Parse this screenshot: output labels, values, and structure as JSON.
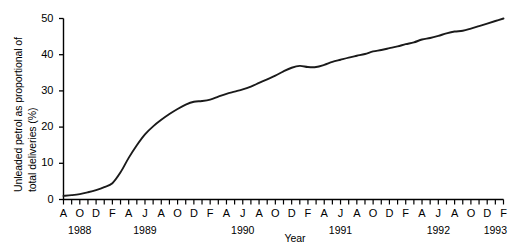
{
  "chart_data": {
    "type": "line",
    "title": "",
    "xlabel": "Year",
    "ylabel": "Unleaded petrol as proportional of total deliveries (%)",
    "ylabel_line1": "Unleaded petrol as proportional of",
    "ylabel_line2": "total deliveries (%)",
    "ylim": [
      0,
      50
    ],
    "yticks": [
      0,
      10,
      20,
      30,
      40,
      50
    ],
    "ytick_labels": [
      "0",
      "10",
      "20",
      "30",
      "40",
      "50"
    ],
    "xtick_labels": [
      "A",
      "O",
      "D",
      "F",
      "A",
      "J",
      "A",
      "O",
      "D",
      "F",
      "A",
      "J",
      "A",
      "O",
      "D",
      "F",
      "A",
      "J",
      "A",
      "O",
      "D",
      "F",
      "A",
      "J",
      "A",
      "O",
      "D",
      "F"
    ],
    "x_minor_ticks": 55,
    "year_labels": [
      "1988",
      "1989",
      "1990",
      "1991",
      "1992",
      "1993"
    ],
    "grid": false,
    "legend": "none",
    "line_color": "#1a1a1a",
    "x": [
      "1988-08",
      "1988-09",
      "1988-10",
      "1988-11",
      "1988-12",
      "1989-01",
      "1989-02",
      "1989-03",
      "1989-04",
      "1989-05",
      "1989-06",
      "1989-07",
      "1989-08",
      "1989-09",
      "1989-10",
      "1989-11",
      "1989-12",
      "1990-01",
      "1990-02",
      "1990-03",
      "1990-04",
      "1990-05",
      "1990-06",
      "1990-07",
      "1990-08",
      "1990-09",
      "1990-10",
      "1990-11",
      "1990-12",
      "1991-01",
      "1991-02",
      "1991-03",
      "1991-04",
      "1991-05",
      "1991-06",
      "1991-07",
      "1991-08",
      "1991-09",
      "1991-10",
      "1991-11",
      "1991-12",
      "1992-01",
      "1992-02",
      "1992-03",
      "1992-04",
      "1992-05",
      "1992-06",
      "1992-07",
      "1992-08",
      "1992-09",
      "1992-10",
      "1992-11",
      "1992-12",
      "1993-01",
      "1993-02"
    ],
    "values": [
      1.0,
      1.2,
      1.5,
      2.0,
      2.6,
      3.4,
      4.5,
      7.5,
      11.5,
      15.0,
      18.0,
      20.2,
      22.0,
      23.6,
      25.0,
      26.2,
      27.0,
      27.2,
      27.6,
      28.4,
      29.2,
      29.8,
      30.4,
      31.2,
      32.2,
      33.2,
      34.2,
      35.4,
      36.4,
      36.9,
      36.6,
      36.6,
      37.2,
      38.0,
      38.6,
      39.2,
      39.7,
      40.2,
      40.9,
      41.3,
      41.8,
      42.3,
      42.9,
      43.4,
      44.2,
      44.6,
      45.2,
      45.9,
      46.4,
      46.6,
      47.2,
      47.9,
      48.6,
      49.3,
      50.0
    ]
  }
}
